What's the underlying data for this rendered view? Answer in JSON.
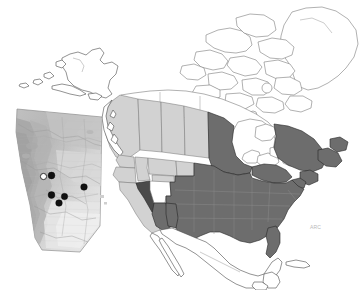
{
  "figure": {
    "width": 362,
    "height": 290,
    "background_color": "#ffffff",
    "credit_text": "ARC"
  },
  "legend_colors": {
    "unshaded": "#ffffff",
    "light_shade": "#d2d2d2",
    "dark_shade": "#6d6d6d",
    "darkest_shade": "#4a4a4a",
    "outline": "#4a4a4a",
    "site_marker_filled": "#111111",
    "site_marker_open": "#ffffff"
  },
  "main_map": {
    "name": "north-america-map",
    "regions": [
      {
        "name": "alaska",
        "shading": "unshaded",
        "label": "Alaska"
      },
      {
        "name": "yukon",
        "shading": "unshaded",
        "label": "Yukon"
      },
      {
        "name": "northwest-territories",
        "shading": "unshaded",
        "label": "Northwest Territories"
      },
      {
        "name": "nunavut",
        "shading": "unshaded",
        "label": "Nunavut"
      },
      {
        "name": "greenland",
        "shading": "unshaded",
        "label": "Greenland"
      },
      {
        "name": "british-columbia",
        "shading": "light_shade",
        "label": "British Columbia"
      },
      {
        "name": "alberta",
        "shading": "light_shade",
        "label": "Alberta"
      },
      {
        "name": "saskatchewan",
        "shading": "light_shade",
        "label": "Saskatchewan"
      },
      {
        "name": "manitoba",
        "shading": "light_shade",
        "label": "Manitoba"
      },
      {
        "name": "ontario",
        "shading": "dark_shade",
        "label": "Ontario"
      },
      {
        "name": "quebec",
        "shading": "dark_shade",
        "label": "Quebec"
      },
      {
        "name": "atlantic-provinces",
        "shading": "dark_shade",
        "label": "Atlantic Provinces"
      },
      {
        "name": "washington",
        "shading": "light_shade",
        "label": "Washington"
      },
      {
        "name": "oregon",
        "shading": "light_shade",
        "label": "Oregon"
      },
      {
        "name": "idaho",
        "shading": "light_shade",
        "label": "Idaho"
      },
      {
        "name": "montana",
        "shading": "light_shade",
        "label": "Montana"
      },
      {
        "name": "wyoming",
        "shading": "light_shade",
        "label": "Wyoming"
      },
      {
        "name": "north-dakota",
        "shading": "light_shade",
        "label": "North Dakota"
      },
      {
        "name": "california",
        "shading": "light_shade",
        "label": "California"
      },
      {
        "name": "nevada",
        "shading": "darkest_shade",
        "label": "Nevada"
      },
      {
        "name": "utah",
        "shading": "unshaded",
        "label": "Utah"
      },
      {
        "name": "western-us-block",
        "shading": "dark_shade",
        "label": "Western United States"
      },
      {
        "name": "central-us-block",
        "shading": "dark_shade",
        "label": "Central United States"
      },
      {
        "name": "eastern-us-block",
        "shading": "dark_shade",
        "label": "Eastern United States"
      },
      {
        "name": "mexico",
        "shading": "unshaded",
        "label": "Mexico"
      },
      {
        "name": "central-america",
        "shading": "unshaded",
        "label": "Central America"
      },
      {
        "name": "cuba",
        "shading": "unshaded",
        "label": "Cuba"
      },
      {
        "name": "great-lakes",
        "shading": "unshaded",
        "label": "Great Lakes"
      },
      {
        "name": "hudson-bay",
        "shading": "unshaded",
        "label": "Hudson Bay"
      }
    ]
  },
  "inset_map": {
    "name": "alberta-inset",
    "region_label": "Alberta",
    "sampling_sites": [
      {
        "id": "site-1",
        "type": "open",
        "x": 43.5,
        "y": 176.5,
        "r": 3.1
      },
      {
        "id": "site-2",
        "type": "filled",
        "x": 51.5,
        "y": 175.5,
        "r": 3.4
      },
      {
        "id": "site-3",
        "type": "filled",
        "x": 84.0,
        "y": 187.0,
        "r": 3.3
      },
      {
        "id": "site-4",
        "type": "filled",
        "x": 51.5,
        "y": 195.0,
        "r": 3.4
      },
      {
        "id": "site-5",
        "type": "filled",
        "x": 64.5,
        "y": 196.5,
        "r": 3.2
      },
      {
        "id": "site-6",
        "type": "filled",
        "x": 59.0,
        "y": 203.0,
        "r": 3.3
      }
    ],
    "site_count_filled": 5,
    "site_count_open": 1
  }
}
